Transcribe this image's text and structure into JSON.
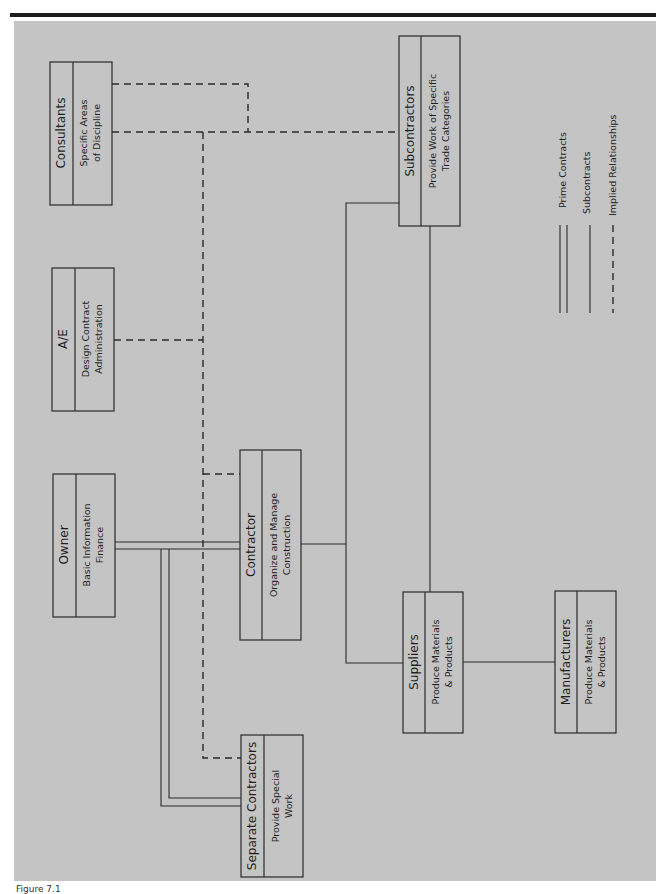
{
  "diagram": {
    "orientation": "rotated-90",
    "nodes": [
      {
        "id": "consultants",
        "title": "Consultants",
        "desc1": "Specific Areas",
        "desc2": "of Discipline"
      },
      {
        "id": "ae",
        "title": "A/E",
        "desc1": "Design Contract",
        "desc2": "Administration"
      },
      {
        "id": "owner",
        "title": "Owner",
        "desc1": "Basic Information",
        "desc2": "Finance"
      },
      {
        "id": "contractor",
        "title": "Contractor",
        "desc1": "Organize and Manage",
        "desc2": "Construction"
      },
      {
        "id": "separate",
        "title": "Separate Contractors",
        "desc1": "Provide Special",
        "desc2": "Work"
      },
      {
        "id": "subcontractors",
        "title": "Subcontractors",
        "desc1": "Provide Work of Specific",
        "desc2": "Trade Categories"
      },
      {
        "id": "suppliers",
        "title": "Suppliers",
        "desc1": "Produce Materials",
        "desc2": "& Products"
      },
      {
        "id": "manufacturers",
        "title": "Manufacturers",
        "desc1": "Produce Materials",
        "desc2": "& Products"
      }
    ],
    "edges": [
      {
        "from": "owner",
        "to": "contractor",
        "type": "prime"
      },
      {
        "from": "owner",
        "to": "separate",
        "type": "prime"
      },
      {
        "from": "contractor",
        "to": "subcontractors",
        "type": "sub"
      },
      {
        "from": "contractor",
        "to": "suppliers",
        "type": "sub"
      },
      {
        "from": "subcontractors",
        "to": "suppliers",
        "type": "sub"
      },
      {
        "from": "suppliers",
        "to": "manufacturers",
        "type": "sub"
      },
      {
        "from": "consultants",
        "to": "subcontractors",
        "type": "implied"
      },
      {
        "from": "consultants",
        "to": "contractor",
        "type": "implied"
      },
      {
        "from": "ae",
        "to": "contractor",
        "type": "implied"
      },
      {
        "from": "ae",
        "to": "separate",
        "type": "implied"
      }
    ],
    "legend": {
      "prime": "Prime Contracts",
      "sub": "Subcontracts",
      "implied": "Implied Relationships"
    },
    "caption": "Figure 7.1"
  }
}
